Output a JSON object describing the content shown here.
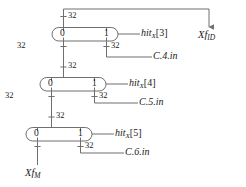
{
  "diagram": {
    "colors": {
      "wire": "#6f6f6f",
      "text": "#1a1a1a",
      "background": "#ffffff"
    },
    "bit_width_label": "32",
    "mux_port_low": "0",
    "mux_port_high": "1",
    "muxes": [
      {
        "id": "mux-hit3",
        "port0": "0",
        "port1": "1",
        "select": {
          "name": "hit",
          "sub": "X",
          "index": "[3]"
        },
        "data_in": "C.4.in",
        "top_width": "32",
        "left_width": "32",
        "right_width": "32"
      },
      {
        "id": "mux-hit4",
        "port0": "0",
        "port1": "1",
        "select": {
          "name": "hit",
          "sub": "X",
          "index": "[4]"
        },
        "data_in": "C.5.in",
        "top_width": "32",
        "left_width": "32",
        "right_width": "32"
      },
      {
        "id": "mux-hit5",
        "port0": "0",
        "port1": "1",
        "select": {
          "name": "hit",
          "sub": "X",
          "index": "[5]"
        },
        "data_in": "C.6.in",
        "top_width": "32",
        "left_width": "32",
        "right_width": "32"
      }
    ],
    "output": {
      "name": "Xf",
      "sub": "ID"
    },
    "input": {
      "name": "Xf",
      "sub": "M"
    },
    "widths": {
      "w1": "32",
      "w2": "32",
      "w3": "32",
      "w4": "32",
      "w5": "32",
      "w6": "32",
      "w7": "32",
      "w8": "32",
      "w9": "32"
    }
  }
}
